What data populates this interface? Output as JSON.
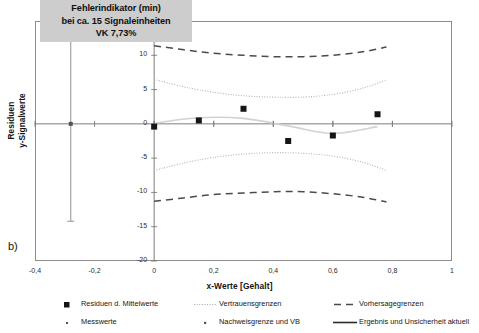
{
  "panel": {
    "label": "b)"
  },
  "callout": {
    "line1": "Fehlerindikator (min)",
    "line2": "bei ca. 15 Signaleinheiten",
    "line3": "VK 7,73%",
    "bg": "#cdcdcd"
  },
  "chart_data": {
    "type": "scatter",
    "title": "",
    "xlabel": "x-Werte [Gehalt]",
    "ylabel_line1": "Residuen",
    "ylabel_line2": "y-Signalwerte",
    "xlim": [
      -0.4,
      1.0
    ],
    "ylim": [
      -20,
      15
    ],
    "xticks": [
      "-0,4",
      "-0,2",
      "0",
      "0,2",
      "0,4",
      "0,6",
      "0,8",
      "1"
    ],
    "xtick_values": [
      -0.4,
      -0.2,
      0,
      0.2,
      0.4,
      0.6,
      0.8,
      1.0
    ],
    "yticks": [
      "15",
      "10",
      "5",
      "0",
      "-5",
      "-10",
      "-15",
      "-20"
    ],
    "ytick_values": [
      15,
      10,
      5,
      0,
      -5,
      -10,
      -15,
      -20
    ],
    "grid": false,
    "legend_position": "bottom",
    "series": [
      {
        "name": "Residuen d. Mittelwerte",
        "style": "square-marker",
        "x": [
          0.0,
          0.15,
          0.3,
          0.45,
          0.6,
          0.75
        ],
        "values": [
          -0.4,
          0.5,
          2.2,
          -2.5,
          -1.7,
          1.4
        ]
      },
      {
        "name": "Messwerte",
        "style": "dot-marker",
        "x": [
          0.0,
          0.2,
          0.4,
          0.6,
          0.8
        ],
        "values": [
          0,
          0,
          0,
          0,
          0
        ]
      },
      {
        "name": "Vertrauensgrenzen",
        "style": "dotted",
        "upper_x": [
          0.0,
          0.1,
          0.2,
          0.3,
          0.4,
          0.5,
          0.6,
          0.7,
          0.78
        ],
        "upper_y": [
          6.5,
          5.4,
          4.6,
          4.1,
          3.9,
          3.9,
          4.3,
          5.2,
          6.4
        ],
        "lower_x": [
          0.0,
          0.1,
          0.2,
          0.3,
          0.4,
          0.5,
          0.6,
          0.7,
          0.78
        ],
        "lower_y": [
          -6.8,
          -5.7,
          -4.9,
          -4.4,
          -4.2,
          -4.3,
          -4.7,
          -5.6,
          -6.8
        ]
      },
      {
        "name": "Vorhersagegrenzen",
        "style": "dashed",
        "upper_x": [
          0.0,
          0.1,
          0.2,
          0.3,
          0.4,
          0.5,
          0.6,
          0.7,
          0.78
        ],
        "upper_y": [
          11.4,
          10.8,
          10.3,
          10.0,
          9.8,
          9.8,
          10.0,
          10.5,
          11.2
        ],
        "lower_x": [
          0.0,
          0.1,
          0.2,
          0.3,
          0.4,
          0.5,
          0.6,
          0.7,
          0.78
        ],
        "lower_y": [
          -11.3,
          -10.8,
          -10.3,
          -10.1,
          -9.9,
          -9.9,
          -10.2,
          -10.7,
          -11.4
        ]
      },
      {
        "name": "Ergebnis und Unsicherheit aktuell",
        "style": "solid-line",
        "x": [
          0.0,
          0.15,
          0.3,
          0.45,
          0.6,
          0.75
        ],
        "values": [
          0.1,
          0.9,
          0.8,
          -0.3,
          -1.4,
          -0.4
        ]
      },
      {
        "name": "Nachweisgrenze und VB",
        "style": "error-bar",
        "x": -0.28,
        "center": 0,
        "upper": 15.0,
        "lower": -14.2
      }
    ],
    "annotations": [
      {
        "text": "Fehlerindikator (min)",
        "x": -0.28,
        "y": 15
      },
      {
        "text": "bei ca. 15 Signaleinheiten",
        "x": -0.28,
        "y": 15
      },
      {
        "text": "VK 7,73%",
        "x": -0.28,
        "y": 15
      }
    ]
  },
  "legend": {
    "items": [
      {
        "label": "Residuen d. Mittelwerte",
        "symbol": "filled-square"
      },
      {
        "label": "Vertrauensgrenzen",
        "symbol": "dotted-line"
      },
      {
        "label": "Vorhersagegrenzen",
        "symbol": "dashed-line"
      },
      {
        "label": "Messwerte",
        "symbol": "small-dot"
      },
      {
        "label": "Nachweisgrenze und VB",
        "symbol": "plus-dot"
      },
      {
        "label": "Ergebnis und Unsicherheit aktuell",
        "symbol": "solid-line"
      }
    ]
  },
  "colors": {
    "frame": "#8d8d8d",
    "axis": "#6f6f6f",
    "marker": "#151515",
    "dashed": "#4b4b4b",
    "dotted": "#b3b3b3",
    "solid": "#d2d2d2",
    "errorbar": "#9a9a9a"
  }
}
